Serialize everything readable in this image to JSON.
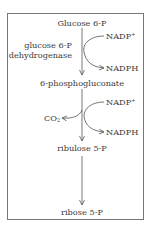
{
  "diagram": {
    "type": "metabolic-pathway",
    "title": "",
    "nodes": [
      {
        "id": "glucose6p",
        "label": "Glucose 6-P"
      },
      {
        "id": "phosphogluconate",
        "label": "6-phosphogluconate"
      },
      {
        "id": "ribulose5p",
        "label": "ribulose 5-P"
      },
      {
        "id": "ribose5p",
        "label": "ribose 5-P"
      }
    ],
    "enzyme": {
      "line1": "glucose 6-P",
      "line2": "dehydrogenase"
    },
    "step1": {
      "cofactor_in": "NADP",
      "cofactor_in_sup": "+",
      "cofactor_out": "NADPH"
    },
    "step2": {
      "cofactor_in": "NADP",
      "cofactor_in_sup": "+",
      "cofactor_out": "NADPH",
      "byproduct": "CO",
      "byproduct_sub": "2"
    },
    "edges": [
      {
        "from": "glucose6p",
        "to": "phosphogluconate"
      },
      {
        "from": "phosphogluconate",
        "to": "ribulose5p"
      },
      {
        "from": "ribulose5p",
        "to": "ribose5p"
      }
    ],
    "colors": {
      "line": "#555555",
      "border": "#777777",
      "text": "#3a3a3a"
    }
  }
}
